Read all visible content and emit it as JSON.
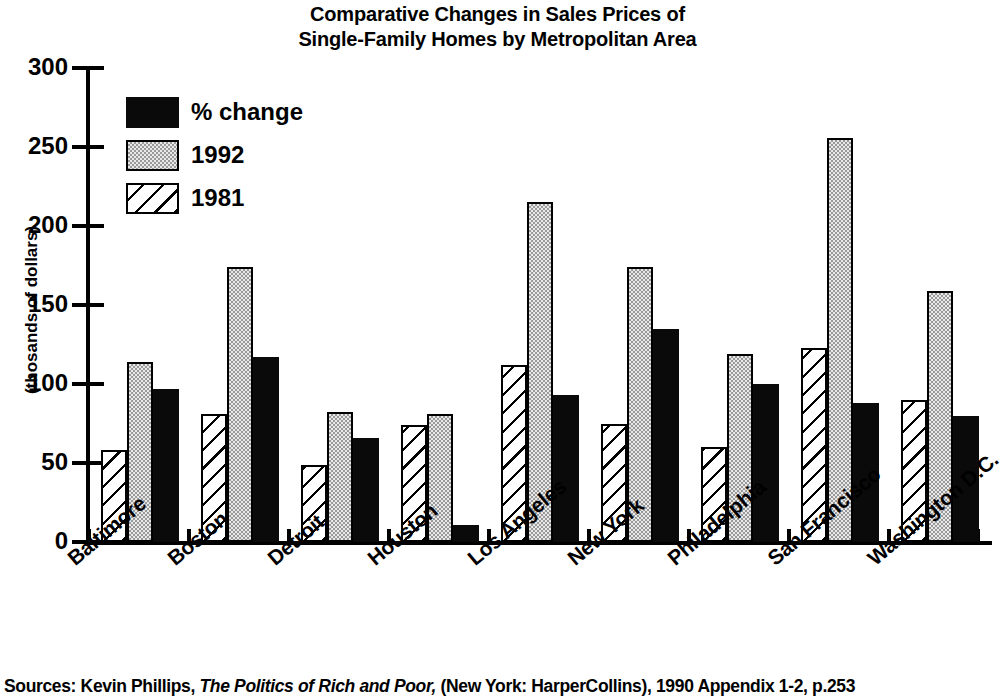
{
  "chart_data": {
    "type": "bar",
    "title": "Comparative Changes in Sales Prices of Single-Family Homes by Metropolitan Area",
    "title_line1": "Comparative Changes in Sales Prices of",
    "title_line2": "Single-Family Homes by Metropolitan Area",
    "xlabel": "",
    "ylabel": "(thosands of dollars)",
    "ylim": [
      0,
      300
    ],
    "yticks": [
      0,
      50,
      100,
      150,
      200,
      250,
      300
    ],
    "ytick_labels": [
      "0",
      "50",
      "100",
      "150",
      "200",
      "250",
      "300"
    ],
    "grid": false,
    "legend_position": "upper-left-inside",
    "categories": [
      "Baltimore",
      "Boston",
      "Detroit",
      "Houston",
      "Los Angeles",
      "New York",
      "Philadelphia",
      "San Francisco",
      "Washington D.C."
    ],
    "series": [
      {
        "name": "1981",
        "fill": "diagonal-hatch",
        "color": "#ffffff",
        "values": [
          58,
          81,
          49,
          74,
          112,
          75,
          60,
          123,
          90
        ]
      },
      {
        "name": "1992",
        "fill": "gray-dotted",
        "color": "#c9c9c9",
        "values": [
          114,
          174,
          82,
          81,
          215,
          174,
          119,
          256,
          159
        ]
      },
      {
        "name": "% change",
        "fill": "solid",
        "color": "#000000",
        "values": [
          97,
          117,
          66,
          11,
          93,
          135,
          100,
          88,
          80
        ]
      }
    ],
    "series_draw_order": [
      "1981",
      "1992",
      "% change"
    ],
    "legend_entries": [
      "% change",
      "1992",
      "1981"
    ],
    "source": {
      "prefix": "Sources: Kevin Phillips,",
      "italic": "The Politics of Rich and Poor,",
      "suffix": "(New York: HarperCollins), 1990 Appendix 1-2, p.253"
    }
  }
}
